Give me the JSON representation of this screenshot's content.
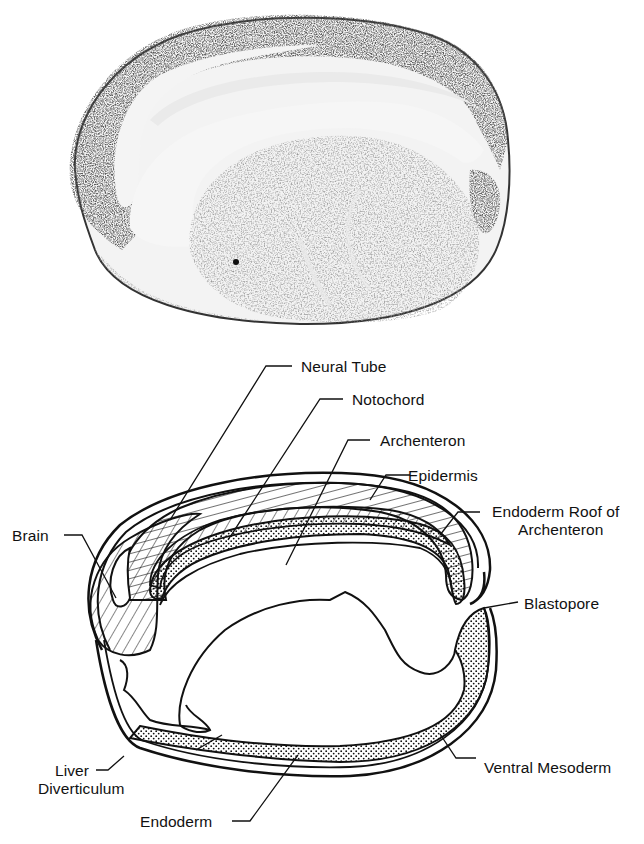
{
  "figure": {
    "photo": {
      "description": "Micrograph: sagittal section of embryo (tailbud stage) showing neural tube, notochord, archenteron and yolky endoderm"
    },
    "diagram": {
      "labels": [
        {
          "id": "neural-tube",
          "text": "Neural Tube"
        },
        {
          "id": "notochord",
          "text": "Notochord"
        },
        {
          "id": "archenteron",
          "text": "Archenteron"
        },
        {
          "id": "epidermis",
          "text": "Epidermis"
        },
        {
          "id": "endoderm-roof-line1",
          "text": "Endoderm Roof of"
        },
        {
          "id": "endoderm-roof-line2",
          "text": "Archenteron"
        },
        {
          "id": "brain",
          "text": "Brain"
        },
        {
          "id": "blastopore",
          "text": "Blastopore"
        },
        {
          "id": "liver-line1",
          "text": "Liver"
        },
        {
          "id": "liver-line2",
          "text": "Diverticulum"
        },
        {
          "id": "ventral-mesoderm",
          "text": "Ventral Mesoderm"
        },
        {
          "id": "endoderm",
          "text": "Endoderm"
        }
      ]
    }
  }
}
